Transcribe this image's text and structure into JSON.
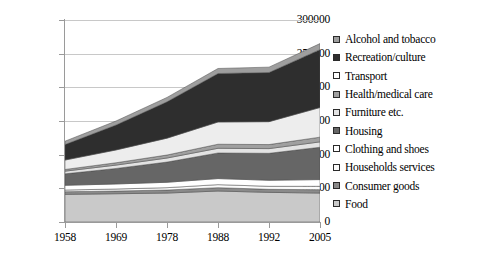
{
  "chart_data": {
    "type": "area",
    "stacked": true,
    "title": "",
    "xlabel": "",
    "ylabel": "",
    "categories": [
      "1958",
      "1969",
      "1978",
      "1988",
      "1992",
      "2005"
    ],
    "ylim": [
      0,
      300000
    ],
    "ytick_labels": [
      "0",
      "50000",
      "100000",
      "150000",
      "200000",
      "250000",
      "300000"
    ],
    "ytick_values": [
      0,
      50000,
      100000,
      150000,
      200000,
      250000,
      300000
    ],
    "grid": true,
    "legend_position": "right",
    "stack_order_bottom_to_top": [
      "Food",
      "Consumer goods",
      "Households services",
      "Clothing and shoes",
      "Housing",
      "Furniture etc.",
      "Health/medical care",
      "Transport",
      "Recreation/culture",
      "Alcohol and tobacco"
    ],
    "series": [
      {
        "name": "Food",
        "color": "#c9c9c9",
        "values": [
          41000,
          42000,
          43000,
          46000,
          44000,
          43000
        ]
      },
      {
        "name": "Consumer goods",
        "color": "#8a8a8a",
        "values": [
          4000,
          4000,
          4500,
          5000,
          4500,
          5000
        ]
      },
      {
        "name": "Households services",
        "color": "#fbfbfb",
        "values": [
          2500,
          3000,
          3500,
          4500,
          4500,
          5000
        ]
      },
      {
        "name": "Clothing and shoes",
        "color": "#ffffff",
        "values": [
          7000,
          7500,
          8000,
          9000,
          9000,
          10000
        ]
      },
      {
        "name": "Housing",
        "color": "#666666",
        "values": [
          17000,
          23000,
          30000,
          38000,
          40000,
          48000
        ]
      },
      {
        "name": "Furniture etc.",
        "color": "#e3e3e3",
        "values": [
          4000,
          5000,
          6000,
          7000,
          7000,
          8000
        ]
      },
      {
        "name": "Health/medical care",
        "color": "#a0a0a0",
        "values": [
          2500,
          3500,
          4500,
          6000,
          6000,
          7000
        ]
      },
      {
        "name": "Transport",
        "color": "#ededed",
        "values": [
          14000,
          19000,
          25000,
          33000,
          34000,
          44000
        ]
      },
      {
        "name": "Recreation/culture",
        "color": "#2e2e2e",
        "values": [
          23000,
          37000,
          54000,
          72000,
          73000,
          86000
        ]
      },
      {
        "name": "Alcohol and tobacco",
        "color": "#9e9e9e",
        "values": [
          5000,
          6000,
          6500,
          7500,
          8000,
          9000
        ]
      }
    ],
    "totals": [
      120000,
      150000,
      185000,
      228000,
      230000,
      265000
    ]
  },
  "legend": {
    "items": [
      {
        "label": "Alcohol and tobacco",
        "swatch": "#9e9e9e"
      },
      {
        "label": "Recreation/culture",
        "swatch": "#2e2e2e"
      },
      {
        "label": "Transport",
        "swatch": "#ffffff"
      },
      {
        "label": "Health/medical care",
        "swatch": "#a0a0a0"
      },
      {
        "label": "Furniture etc.",
        "swatch": "#e3e3e3"
      },
      {
        "label": "Housing",
        "swatch": "#666666"
      },
      {
        "label": "Clothing and shoes",
        "swatch": "#ffffff"
      },
      {
        "label": "Households services",
        "swatch": "#fbfbfb"
      },
      {
        "label": "Consumer goods",
        "swatch": "#8a8a8a"
      },
      {
        "label": "Food",
        "swatch": "#c9c9c9"
      }
    ]
  }
}
